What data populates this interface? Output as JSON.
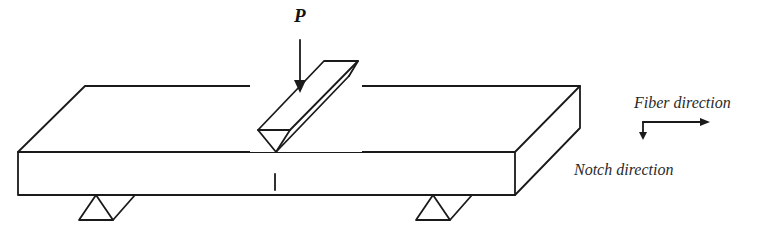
{
  "diagram": {
    "load_label": "P",
    "labels": {
      "fiber_direction": "Fiber direction",
      "notch_direction": "Notch direction"
    },
    "components": [
      "specimen-beam",
      "loading-wedge",
      "left-support",
      "right-support",
      "notch",
      "direction-axes"
    ],
    "colors": {
      "line": "#1a1a1a",
      "background": "#ffffff"
    }
  }
}
